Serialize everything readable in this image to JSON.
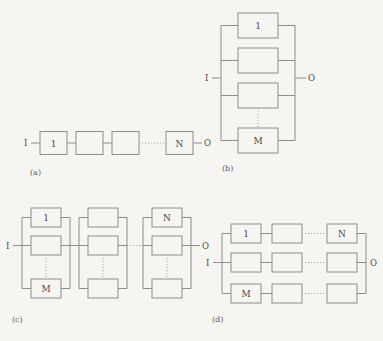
{
  "figure": {
    "background_color": "#f7f5f2",
    "line_color": "#8d8d8d",
    "dotted_line_color": "#a9a9a9",
    "text_color": "#4a4a4a",
    "panels": [
      {
        "id": "a",
        "label": "(a)",
        "topology": "series",
        "input_label": "I",
        "output_label": "O",
        "blocks": [
          {
            "name": "block-1",
            "label": "1"
          },
          {
            "name": "block-2",
            "label": ""
          },
          {
            "name": "block-3",
            "label": ""
          },
          {
            "name": "block-n",
            "label": "N"
          }
        ],
        "connectors": [
          "solid",
          "solid",
          "dotted",
          "solid"
        ]
      },
      {
        "id": "b",
        "label": "(b)",
        "topology": "parallel",
        "input_label": "I",
        "output_label": "O",
        "blocks": [
          {
            "name": "block-1",
            "label": "1"
          },
          {
            "name": "block-2",
            "label": ""
          },
          {
            "name": "block-3",
            "label": ""
          },
          {
            "name": "block-m",
            "label": "M"
          }
        ],
        "connectors": [
          "solid",
          "solid",
          "dotted"
        ]
      },
      {
        "id": "c",
        "label": "(c)",
        "topology": "series-parallel",
        "input_label": "I",
        "output_label": "O",
        "groups": [
          {
            "name": "group-1",
            "blocks": [
              {
                "label": "1"
              },
              {
                "label": ""
              },
              {
                "label": "M"
              }
            ]
          },
          {
            "name": "group-2",
            "blocks": [
              {
                "label": ""
              },
              {
                "label": ""
              },
              {
                "label": ""
              }
            ]
          },
          {
            "name": "group-3",
            "blocks": [
              {
                "label": "N"
              },
              {
                "label": ""
              },
              {
                "label": ""
              }
            ]
          }
        ],
        "group_connectors": [
          "solid",
          "dotted"
        ]
      },
      {
        "id": "d",
        "label": "(d)",
        "topology": "parallel-series",
        "input_label": "I",
        "output_label": "O",
        "rows": [
          {
            "name": "row-1",
            "blocks": [
              {
                "label": "1"
              },
              {
                "label": ""
              },
              {
                "label": "N"
              }
            ]
          },
          {
            "name": "row-2",
            "blocks": [
              {
                "label": ""
              },
              {
                "label": ""
              },
              {
                "label": ""
              }
            ]
          },
          {
            "name": "row-3",
            "blocks": [
              {
                "label": "M"
              },
              {
                "label": ""
              },
              {
                "label": ""
              }
            ]
          }
        ],
        "row_connectors": [
          "solid",
          "dotted"
        ]
      }
    ]
  }
}
